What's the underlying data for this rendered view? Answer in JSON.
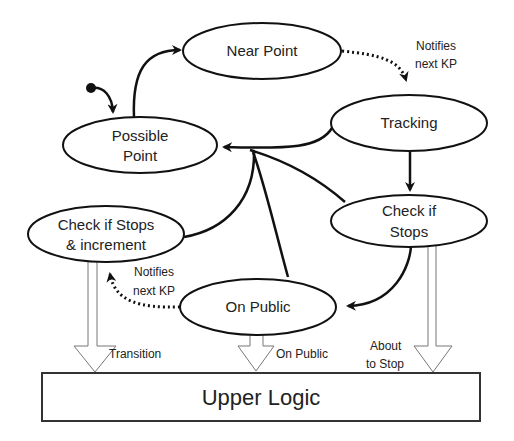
{
  "diagram": {
    "type": "state-machine",
    "nodes": {
      "near_point": {
        "label": "Near Point"
      },
      "tracking": {
        "label": "Tracking"
      },
      "possible_point": {
        "line1": "Possible",
        "line2": "Point"
      },
      "check_if_stops_increment": {
        "line1": "Check if Stops",
        "line2": "& increment"
      },
      "check_if_stops": {
        "line1": "Check if",
        "line2": "Stops"
      },
      "on_public": {
        "label": "On Public"
      },
      "upper_logic": {
        "label": "Upper Logic"
      }
    },
    "edge_labels": {
      "notifies_top": {
        "line1": "Notifies",
        "line2": "next KP"
      },
      "notifies_bottom": {
        "line1": "Notifies",
        "line2": "next KP"
      },
      "transition": "Transition",
      "on_public": "On Public",
      "about_to_stop": {
        "line1": "About",
        "line2": "to Stop"
      }
    },
    "edges": [
      {
        "from": "start",
        "to": "possible_point",
        "style": "solid"
      },
      {
        "from": "possible_point",
        "to": "near_point",
        "style": "solid"
      },
      {
        "from": "near_point",
        "to": "tracking",
        "style": "dotted",
        "label": "Notifies next KP"
      },
      {
        "from": "tracking",
        "to": "check_if_stops",
        "style": "solid"
      },
      {
        "from": "tracking",
        "to": "possible_point",
        "style": "solid"
      },
      {
        "from": "check_if_stops",
        "to": "possible_point",
        "style": "solid"
      },
      {
        "from": "check_if_stops",
        "to": "on_public",
        "style": "solid"
      },
      {
        "from": "on_public",
        "to": "possible_point",
        "style": "solid"
      },
      {
        "from": "check_if_stops_increment",
        "to": "possible_point",
        "style": "solid"
      },
      {
        "from": "on_public",
        "to": "check_if_stops_increment",
        "style": "dotted",
        "label": "Notifies next KP"
      },
      {
        "from": "check_if_stops_increment",
        "to": "upper_logic",
        "style": "hollow-arrow",
        "label": "Transition"
      },
      {
        "from": "on_public",
        "to": "upper_logic",
        "style": "hollow-arrow",
        "label": "On Public"
      },
      {
        "from": "check_if_stops",
        "to": "upper_logic",
        "style": "hollow-arrow",
        "label": "About to Stop"
      }
    ]
  }
}
